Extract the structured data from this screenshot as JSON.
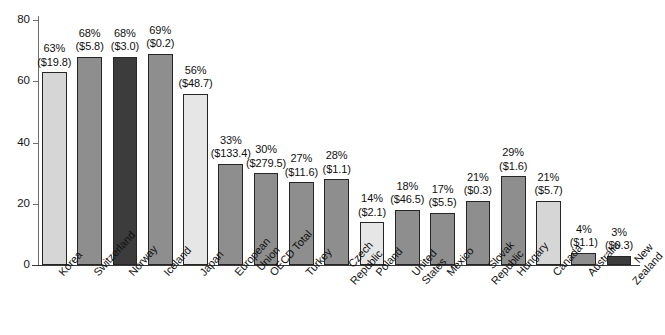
{
  "chart_data": {
    "type": "bar",
    "title": "",
    "subtitle": "",
    "xlabel": "",
    "ylabel": "",
    "ylim": [
      0,
      80
    ],
    "yticks": [
      0,
      20,
      40,
      60,
      80
    ],
    "ytick_labels": [
      "0",
      "20",
      "40",
      "60",
      "80"
    ],
    "grid": false,
    "legend": false,
    "legend_position": "none",
    "categories": [
      "Korea",
      "Switzerland",
      "Norway",
      "Iceland",
      "Japan",
      "European Union",
      "OECD Total",
      "Turkey",
      "Czech Republic",
      "Poland",
      "United States",
      "Mexico",
      "Slovak Republic",
      "Hungary",
      "Canada",
      "Australia",
      "New Zealand"
    ],
    "values": [
      63,
      68,
      68,
      69,
      56,
      33,
      30,
      27,
      28,
      14,
      18,
      17,
      21,
      29,
      21,
      4,
      3
    ],
    "data_labels_pct": [
      "63%",
      "68%",
      "68%",
      "69%",
      "56%",
      "33%",
      "30%",
      "27%",
      "28%",
      "14%",
      "18%",
      "17%",
      "21%",
      "29%",
      "21%",
      "4%",
      "3%"
    ],
    "data_labels_value": [
      "($19.8)",
      "($5.8)",
      "($3.0)",
      "($0.2)",
      "($48.7)",
      "($133.4)",
      "($279.5)",
      "($11.6)",
      "($1.1)",
      "($2.1)",
      "($46.5)",
      "($5.5)",
      "($0.3)",
      "($1.6)",
      "($5.7)",
      "($1.1)",
      "($0.3)"
    ],
    "bar_shades": [
      "light",
      "medium",
      "dark",
      "medium",
      "lighter",
      "medium",
      "medium",
      "medium",
      "medium",
      "lighter",
      "medium",
      "medium",
      "medium",
      "medium",
      "light",
      "medium",
      "dark"
    ],
    "category_label_lines": [
      [
        "Korea"
      ],
      [
        "Switzerland"
      ],
      [
        "Norway"
      ],
      [
        "Iceland"
      ],
      [
        "Japan"
      ],
      [
        "European",
        "Union"
      ],
      [
        "OECD Total"
      ],
      [
        "Turkey"
      ],
      [
        "Czech",
        "Republic"
      ],
      [
        "Poland"
      ],
      [
        "United",
        "States"
      ],
      [
        "Mexico"
      ],
      [
        "Slovak",
        "Republic"
      ],
      [
        "Hungary"
      ],
      [
        "Canada"
      ],
      [
        "Australia"
      ],
      [
        "New",
        "Zealand"
      ]
    ]
  },
  "colors": {
    "light": "#d6d6d6",
    "lighter": "#e6e6e6",
    "medium": "#8e8e8e",
    "dark": "#3c3c3c",
    "axis": "#3a3a3a",
    "text": "#101010",
    "background": "#ffffff"
  }
}
